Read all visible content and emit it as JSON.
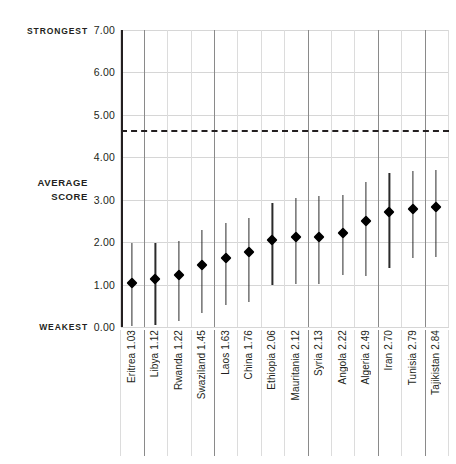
{
  "axis": {
    "strongest_label": "STRONGEST",
    "weakest_label": "WEAKEST",
    "average_score_label": "AVERAGE\nSCORE",
    "average_score_line1": "AVERAGE",
    "average_score_line2": "SCORE"
  },
  "chart_data": {
    "type": "scatter",
    "title": "",
    "subtitle": "",
    "xlabel": "",
    "ylabel": "AVERAGE SCORE",
    "ylim": [
      0,
      7
    ],
    "yticks": [
      0,
      1,
      2,
      3,
      4,
      5,
      6,
      7
    ],
    "ytick_labels": [
      "0.00",
      "1.00",
      "2.00",
      "3.00",
      "4.00",
      "5.00",
      "6.00",
      "7.00"
    ],
    "grid": true,
    "legend": null,
    "axis_annotations": {
      "top": "STRONGEST",
      "bottom": "WEAKEST"
    },
    "reference_line": {
      "value": 4.64,
      "style": "dashed",
      "color": "#231f20",
      "label": ""
    },
    "categories": [
      "Eritrea",
      "Libya",
      "Rwanda",
      "Swaziland",
      "Laos",
      "China",
      "Ethiopia",
      "Mauritania",
      "Syria",
      "Angola",
      "Algeria",
      "Iran",
      "Tunisia",
      "Tajikistan"
    ],
    "tick_labels": [
      "Eritrea  1.03",
      "Libya  1.12",
      "Rwanda  1.22",
      "Swaziland  1.45",
      "Laos  1.63",
      "China  1.76",
      "Ethiopia  2.06",
      "Mauritania  2.12",
      "Syria  2.13",
      "Angola  2.22",
      "Algeria  2.49",
      "Iran  2.70",
      "Tunisia  2.79",
      "Tajikistan  2.84"
    ],
    "values": [
      1.03,
      1.12,
      1.22,
      1.45,
      1.63,
      1.76,
      2.06,
      2.12,
      2.13,
      2.22,
      2.49,
      2.7,
      2.79,
      2.84
    ],
    "error_low": [
      0.02,
      0.05,
      0.14,
      0.33,
      0.52,
      0.58,
      1.0,
      1.02,
      1.02,
      1.22,
      1.2,
      1.4,
      1.62,
      1.66
    ],
    "error_high": [
      1.99,
      1.97,
      2.02,
      2.28,
      2.44,
      2.57,
      2.92,
      3.05,
      3.09,
      3.12,
      3.42,
      3.62,
      3.68,
      3.7
    ]
  }
}
